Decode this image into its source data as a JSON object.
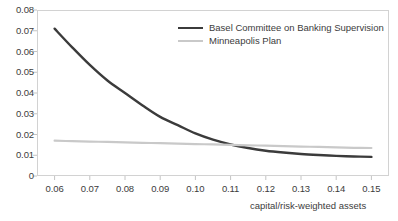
{
  "chart_data": {
    "type": "line",
    "title": "",
    "xlabel": "capital/risk-weighted assets",
    "ylabel": "",
    "xlim": [
      0.055,
      0.155
    ],
    "ylim": [
      0,
      0.08
    ],
    "xticks": [
      "0.06",
      "0.07",
      "0.08",
      "0.09",
      "0.10",
      "0.11",
      "0.12",
      "0.13",
      "0.14",
      "0.15"
    ],
    "yticks": [
      "0",
      "0.01",
      "0.02",
      "0.03",
      "0.04",
      "0.05",
      "0.06",
      "0.07",
      "0.08"
    ],
    "grid": false,
    "legend_position": "top-right",
    "x": [
      0.06,
      0.065,
      0.07,
      0.075,
      0.08,
      0.085,
      0.09,
      0.095,
      0.1,
      0.105,
      0.11,
      0.115,
      0.12,
      0.125,
      0.13,
      0.135,
      0.14,
      0.145,
      0.15
    ],
    "series": [
      {
        "name": "Basel Committee on Banking Supervision",
        "color": "#3b3b3b",
        "width": 2.4,
        "values": [
          0.071,
          0.062,
          0.0535,
          0.046,
          0.04,
          0.034,
          0.0285,
          0.0245,
          0.0205,
          0.0175,
          0.0152,
          0.0135,
          0.0122,
          0.0113,
          0.0106,
          0.0101,
          0.0097,
          0.0094,
          0.0092
        ]
      },
      {
        "name": "Minneapolis Plan",
        "color": "#c9c9c9",
        "width": 2.2,
        "values": [
          0.017,
          0.0168,
          0.0166,
          0.0164,
          0.0162,
          0.016,
          0.0158,
          0.0156,
          0.0154,
          0.0152,
          0.015,
          0.0148,
          0.0146,
          0.0144,
          0.0142,
          0.014,
          0.0138,
          0.0136,
          0.0135
        ]
      }
    ]
  },
  "legend": {
    "entries": [
      {
        "label": "Basel Committee on Banking Supervision"
      },
      {
        "label": "Minneapolis Plan"
      }
    ]
  },
  "axes": {
    "x_title": "capital/risk-weighted assets"
  }
}
